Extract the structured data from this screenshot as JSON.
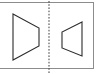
{
  "panel": {
    "label": "symmetry-figure-panel",
    "background_color": "#ffffff",
    "border_color": "#8c8c8c",
    "width_px": 94,
    "height_px": 67
  },
  "mirror_axis": {
    "name": "dotted-mirror-line",
    "orientation": "vertical",
    "x_px": 49,
    "style": "dotted",
    "color": "#3c3c3c"
  },
  "shapes": [
    {
      "name": "left-trapezoid",
      "description": "trapezoid pointing right",
      "stroke_color": "#2b2b2b",
      "fill": "none",
      "points": "13,14 39,28 39,46 13,60"
    },
    {
      "name": "right-trapezoid",
      "description": "mirrored trapezoid pointing left",
      "stroke_color": "#2b2b2b",
      "fill": "none",
      "points": "82,22 62,32 62,48 82,56"
    }
  ]
}
